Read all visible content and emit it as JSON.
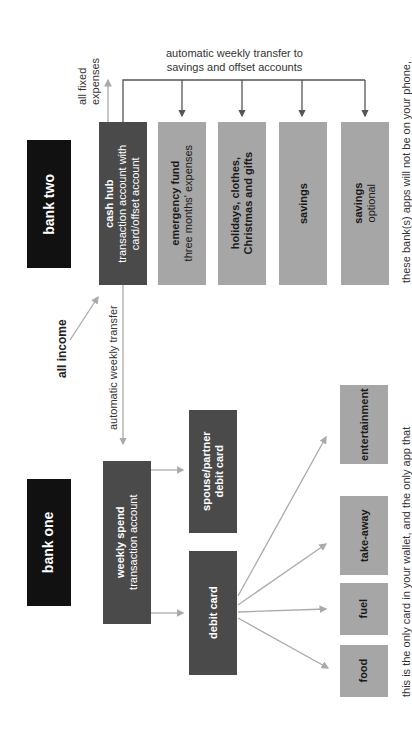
{
  "bank_two": {
    "label": "bank two",
    "cash_hub": {
      "title": "cash hub",
      "line1": "transaction account with",
      "line2": "card/offset account"
    },
    "accounts": [
      {
        "title": "emergency fund",
        "sub": "three months' expenses"
      },
      {
        "title": "holidays, clothes,",
        "sub_bold": "Christmas and gifts"
      },
      {
        "title": "savings"
      },
      {
        "title": "savings",
        "sub": "optional"
      }
    ],
    "transfer_label_1": "automatic weekly transfer to",
    "transfer_label_2": "savings and offset accounts",
    "fixed_label_1": "all fixed",
    "fixed_label_2": "expenses",
    "note": "these bank(s) apps will not be on your phone,"
  },
  "income_label": "all income",
  "weekly_transfer_label": "automatic weekly transfer",
  "bank_one": {
    "label": "bank one",
    "weekly_spend": {
      "title": "weekly spend",
      "sub": "transaction account"
    },
    "partner_card": {
      "line1": "spouse/partner",
      "line2": "debit card"
    },
    "debit_card": "debit card",
    "categories": [
      "entertainment",
      "take-away",
      "fuel",
      "food"
    ],
    "note": "this is the only card in your wallet, and the only app that"
  }
}
